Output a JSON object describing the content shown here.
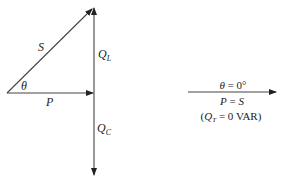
{
  "diagram": {
    "type": "power-triangle",
    "left_figure": {
      "vectors": [
        {
          "name": "S",
          "label": "S",
          "from": [
            7,
            93
          ],
          "to": [
            94,
            8
          ]
        },
        {
          "name": "P",
          "label": "P",
          "from": [
            7,
            93
          ],
          "to": [
            94,
            93
          ]
        },
        {
          "name": "QL",
          "label_main": "Q",
          "label_sub": "L",
          "from": [
            94,
            93
          ],
          "to": [
            94,
            8
          ]
        },
        {
          "name": "QC",
          "label_main": "Q",
          "label_sub": "C",
          "from": [
            94,
            93
          ],
          "to": [
            94,
            175
          ]
        }
      ],
      "angle_label": "θ"
    },
    "right_figure": {
      "vector": {
        "name": "S=P",
        "from": [
          188,
          92
        ],
        "to": [
          276,
          92
        ]
      },
      "line1": {
        "var": "θ",
        "rest": " = 0°"
      },
      "line2": {
        "var1": "P",
        "eq": " = ",
        "var2": "S"
      },
      "line3": {
        "open": "(",
        "var": "Q",
        "sub": "T",
        "rest": " = 0 VAR)"
      }
    },
    "colors": {
      "stroke": "#333333",
      "background": "#ffffff"
    }
  }
}
